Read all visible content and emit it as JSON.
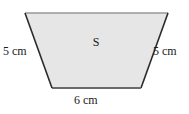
{
  "figure": {
    "name": "trapezoid-with-dimensions",
    "shape_label": "S",
    "background_color": "#ffffff",
    "fill_color": "#e6e6e6",
    "top_edge_color": "#999999",
    "bottom_edge_color": "#6b6b6b",
    "side_edge_color": "#2b2b2b",
    "labels": {
      "left_side": "5 cm",
      "right_side": "5 cm",
      "bottom_side": "6 cm"
    },
    "geometry": {
      "top_left": "25,13",
      "top_right": "168,13",
      "bottom_right": "141,88",
      "bottom_left": "52,88",
      "points": "25,13 168,13 141,88 52,88"
    }
  }
}
